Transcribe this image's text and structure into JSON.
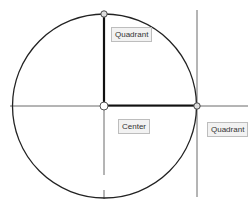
{
  "diagram": {
    "labels": {
      "quadrant_top": "Quadrant",
      "center": "Center",
      "quadrant_right": "Quadrant"
    },
    "colors": {
      "stroke": "#222222",
      "label_bg": "#f2f2f2",
      "label_border": "#bdbdbd"
    }
  }
}
